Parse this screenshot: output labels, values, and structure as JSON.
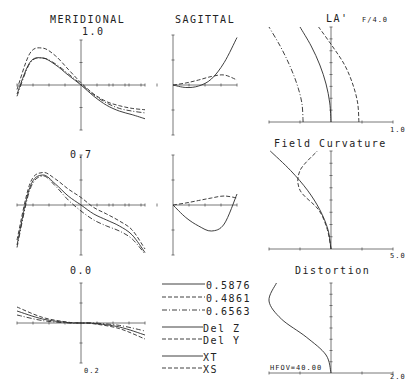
{
  "colors": {
    "ink": "#2a2a2a",
    "axis": "#555555",
    "background": "#ffffff"
  },
  "headers": {
    "meridional": "MERIDIONAL",
    "sagittal": "SAGITTAL",
    "la": "LA'",
    "fnum": "F/4.0",
    "field_curvature": "Field Curvature",
    "distortion": "Distortion"
  },
  "field_labels": {
    "f10": "1.0",
    "f07": "0.7",
    "f00": "0.0"
  },
  "scales": {
    "ray_fan": "0.2",
    "la": "1.0",
    "field_curvature": "5.0",
    "distortion": "2.0"
  },
  "hfov": "HFOV=40.00",
  "legend": {
    "wavelengths": [
      {
        "style": "solid",
        "label": "0.5876"
      },
      {
        "style": "dashed",
        "label": "0.4861"
      },
      {
        "style": "dashdot",
        "label": "0.6563"
      }
    ],
    "aberrations": [
      {
        "style": "solid",
        "label": "Del Z"
      },
      {
        "style": "dashed",
        "label": "Del Y"
      }
    ],
    "astig": [
      {
        "style": "solid",
        "label": "XT"
      },
      {
        "style": "dashed",
        "label": "XS"
      }
    ]
  },
  "chart_data": [
    {
      "type": "line",
      "title": "MERIDIONAL 1.0",
      "field": 1.0,
      "xlabel": "",
      "ylabel": "",
      "grid": false,
      "note": "Meridional ray fan, normalized pupil x in [-1,1], scale 0.2",
      "series": [
        {
          "name": "0.5876",
          "style": "solid",
          "x": [
            -1,
            -0.8,
            -0.6,
            -0.4,
            -0.2,
            0,
            0.2,
            0.4,
            0.6,
            0.8,
            1
          ],
          "y": [
            -0.2,
            0.5,
            0.6,
            0.45,
            0.22,
            0,
            -0.25,
            -0.45,
            -0.58,
            -0.66,
            -0.75
          ]
        },
        {
          "name": "0.4861",
          "style": "dashed",
          "x": [
            -1,
            -0.8,
            -0.6,
            -0.4,
            -0.2,
            0,
            0.2,
            0.4,
            0.6,
            0.8,
            1
          ],
          "y": [
            -0.1,
            0.7,
            0.82,
            0.65,
            0.35,
            0.05,
            -0.2,
            -0.37,
            -0.46,
            -0.52,
            -0.55
          ]
        },
        {
          "name": "0.6563",
          "style": "dashdot",
          "x": [
            -1,
            -0.8,
            -0.6,
            -0.4,
            -0.2,
            0,
            0.2,
            0.4,
            0.6,
            0.8,
            1
          ],
          "y": [
            -0.25,
            0.48,
            0.6,
            0.47,
            0.25,
            0.02,
            -0.22,
            -0.4,
            -0.52,
            -0.58,
            -0.62
          ]
        }
      ]
    },
    {
      "type": "line",
      "title": "SAGITTAL 1.0",
      "field": 1.0,
      "grid": false,
      "series": [
        {
          "name": "0.5876",
          "style": "solid",
          "x": [
            0,
            0.2,
            0.4,
            0.6,
            0.8,
            1
          ],
          "y": [
            0,
            -0.05,
            -0.02,
            0.12,
            0.45,
            0.95
          ]
        },
        {
          "name": "0.4861",
          "style": "dashed",
          "x": [
            0,
            0.2,
            0.4,
            0.6,
            0.8,
            1
          ],
          "y": [
            0,
            0.04,
            0.1,
            0.17,
            0.2,
            0.1
          ]
        }
      ]
    },
    {
      "type": "line",
      "title": "MERIDIONAL 0.7",
      "field": 0.7,
      "grid": false,
      "series": [
        {
          "name": "0.5876",
          "style": "solid",
          "x": [
            -1,
            -0.8,
            -0.6,
            -0.4,
            -0.2,
            0,
            0.2,
            0.4,
            0.6,
            0.8,
            1
          ],
          "y": [
            -0.8,
            0.35,
            0.6,
            0.42,
            0.18,
            0,
            -0.18,
            -0.3,
            -0.42,
            -0.6,
            -0.95
          ]
        },
        {
          "name": "0.4861",
          "style": "dashed",
          "x": [
            -1,
            -0.8,
            -0.6,
            -0.4,
            -0.2,
            0,
            0.2,
            0.4,
            0.6,
            0.8,
            1
          ],
          "y": [
            -0.7,
            0.42,
            0.65,
            0.52,
            0.32,
            0.15,
            -0.05,
            -0.18,
            -0.32,
            -0.5,
            -0.88
          ]
        },
        {
          "name": "0.6563",
          "style": "dashdot",
          "x": [
            -1,
            -0.8,
            -0.6,
            -0.4,
            -0.2,
            0,
            0.2,
            0.4,
            0.6,
            0.8,
            1
          ],
          "y": [
            -0.85,
            0.3,
            0.58,
            0.38,
            0.1,
            -0.12,
            -0.3,
            -0.42,
            -0.52,
            -0.68,
            -0.98
          ]
        }
      ]
    },
    {
      "type": "line",
      "title": "SAGITTAL 0.7",
      "field": 0.7,
      "grid": false,
      "series": [
        {
          "name": "0.5876",
          "style": "solid",
          "x": [
            0,
            0.2,
            0.4,
            0.6,
            0.8,
            1
          ],
          "y": [
            0,
            -0.25,
            -0.42,
            -0.52,
            -0.38,
            0.22
          ]
        },
        {
          "name": "0.4861",
          "style": "dashed",
          "x": [
            0,
            0.2,
            0.4,
            0.6,
            0.8,
            1
          ],
          "y": [
            0,
            0.04,
            0.09,
            0.14,
            0.18,
            0.14
          ]
        }
      ]
    },
    {
      "type": "line",
      "title": "MERIDIONAL 0.0",
      "field": 0.0,
      "grid": false,
      "series": [
        {
          "name": "0.5876",
          "style": "solid",
          "x": [
            -1,
            -0.6,
            -0.2,
            0,
            0.2,
            0.6,
            1
          ],
          "y": [
            0.3,
            0.1,
            0.01,
            0,
            -0.01,
            -0.1,
            -0.3
          ]
        },
        {
          "name": "0.4861",
          "style": "dashed",
          "x": [
            -1,
            -0.6,
            -0.2,
            0,
            0.2,
            0.6,
            1
          ],
          "y": [
            0.4,
            0.14,
            0.02,
            0,
            -0.02,
            -0.14,
            -0.4
          ]
        },
        {
          "name": "0.6563",
          "style": "dashdot",
          "x": [
            -1,
            -0.6,
            -0.2,
            0,
            0.2,
            0.6,
            1
          ],
          "y": [
            0.2,
            0.06,
            0.0,
            0,
            0.0,
            -0.06,
            -0.2
          ]
        }
      ]
    },
    {
      "type": "line",
      "title": "LA' F/4.0",
      "xlabel": "1.0",
      "grid": false,
      "note": "Longitudinal aberration vs pupil height (y from 0 to 1)",
      "series": [
        {
          "name": "0.5876",
          "style": "solid",
          "y": [
            0,
            0.2,
            0.4,
            0.6,
            0.8,
            1
          ],
          "x": [
            0,
            -0.02,
            -0.08,
            -0.18,
            -0.32,
            -0.5
          ]
        },
        {
          "name": "0.4861",
          "style": "dashed",
          "y": [
            0,
            0.2,
            0.4,
            0.6,
            0.8,
            1
          ],
          "x": [
            0.45,
            0.43,
            0.35,
            0.22,
            0.02,
            -0.2
          ]
        },
        {
          "name": "0.6563",
          "style": "dashdot",
          "y": [
            0,
            0.2,
            0.4,
            0.6,
            0.8,
            1
          ],
          "x": [
            -0.45,
            -0.47,
            -0.55,
            -0.67,
            -0.82,
            -1.0
          ]
        }
      ]
    },
    {
      "type": "line",
      "title": "Field Curvature",
      "xlabel": "5.0",
      "grid": false,
      "series": [
        {
          "name": "XT",
          "style": "solid",
          "y": [
            0,
            0.2,
            0.4,
            0.6,
            0.8,
            1
          ],
          "x": [
            0,
            -0.05,
            -0.18,
            -0.38,
            -0.65,
            -0.98
          ]
        },
        {
          "name": "XS",
          "style": "dashed",
          "y": [
            0,
            0.2,
            0.4,
            0.6,
            0.8,
            1
          ],
          "x": [
            0,
            -0.06,
            -0.2,
            -0.5,
            -0.5,
            -0.22
          ]
        }
      ]
    },
    {
      "type": "line",
      "title": "Distortion",
      "xlabel": "2.0",
      "annotation": "HFOV=40.00",
      "grid": false,
      "series": [
        {
          "name": "Distortion",
          "style": "solid",
          "y": [
            0,
            0.2,
            0.4,
            0.6,
            0.8,
            1
          ],
          "x": [
            0,
            -0.08,
            -0.4,
            -0.8,
            -1.0,
            -0.88
          ]
        }
      ]
    }
  ]
}
